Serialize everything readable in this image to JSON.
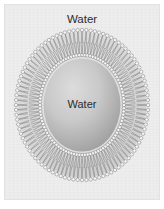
{
  "figure": {
    "type": "liposome-bilayer-cross-section",
    "title": "",
    "background_color": "#ffffff",
    "panel_color": "#ededed",
    "panel_border_color": "#e2e2e2"
  },
  "labels": {
    "outer_water": "Water",
    "inner_water": "Water"
  },
  "vesicle": {
    "center_x": 82,
    "center_y": 105,
    "outer_radius_x": 66,
    "outer_radius_y": 75,
    "inner_radius_x": 42,
    "inner_radius_y": 50,
    "lumen_radius_x": 38,
    "lumen_radius_y": 46,
    "lipid_count": 96,
    "head_color": "#f4f4f4",
    "head_stroke_color": "#7b7b7b",
    "tail_color": "#8f8f8f",
    "leaflet_band_color": "#b9b9b9",
    "lumen_fill_light": "#d6d6d6",
    "lumen_fill_dark": "#9c9c9c"
  },
  "icons": {
    "lipid": "phospholipid-icon"
  }
}
